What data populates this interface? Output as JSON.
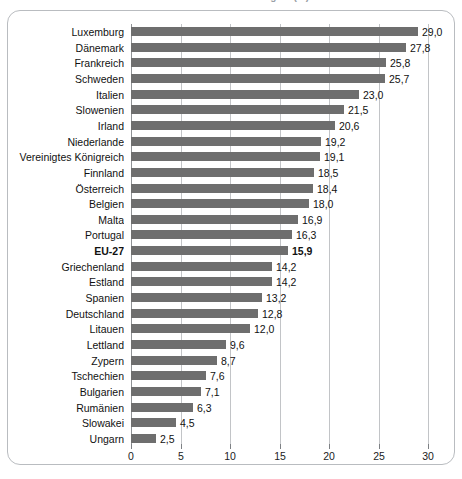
{
  "title_sliver": {
    "text": "Anteil erneuerbarer Energien (%)"
  },
  "axis": {
    "ticks": [
      "0",
      "5",
      "10",
      "15",
      "20",
      "25",
      "30"
    ],
    "min": 0,
    "max": 30,
    "step": 5
  },
  "style": {
    "bar_color": "#6e6e6e",
    "grid_color": "#c2c4c7",
    "frame_color": "#b9bcc0",
    "text_color": "#111111"
  },
  "chart_data": {
    "type": "bar",
    "orientation": "horizontal",
    "title": "Anteil erneuerbarer Energien (%)",
    "xlabel": "",
    "ylabel": "",
    "xlim": [
      0,
      30
    ],
    "xticks": [
      0,
      5,
      10,
      15,
      20,
      25,
      30
    ],
    "grid": true,
    "legend": false,
    "decimal_separator": ",",
    "categories": [
      "Luxemburg",
      "Dänemark",
      "Frankreich",
      "Schweden",
      "Italien",
      "Slowenien",
      "Irland",
      "Niederlande",
      "Vereinigtes Königreich",
      "Finnland",
      "Österreich",
      "Belgien",
      "Malta",
      "Portugal",
      "EU-27",
      "Griechenland",
      "Estland",
      "Spanien",
      "Deutschland",
      "Litauen",
      "Lettland",
      "Zypern",
      "Tschechien",
      "Bulgarien",
      "Rumänien",
      "Slowakei",
      "Ungarn"
    ],
    "values": [
      29.0,
      27.8,
      25.8,
      25.7,
      23.0,
      21.5,
      20.6,
      19.2,
      19.1,
      18.5,
      18.4,
      18.0,
      16.9,
      16.3,
      15.9,
      14.2,
      14.2,
      13.2,
      12.8,
      12.0,
      9.6,
      8.7,
      7.6,
      7.1,
      6.3,
      4.5,
      2.5
    ],
    "value_labels": [
      "29,0",
      "27,8",
      "25,8",
      "25,7",
      "23,0",
      "21,5",
      "20,6",
      "19,2",
      "19,1",
      "18,5",
      "18,4",
      "18,0",
      "16,9",
      "16,3",
      "15,9",
      "14,2",
      "14,2",
      "13,2",
      "12,8",
      "12,0",
      "9,6",
      "8,7",
      "7,6",
      "7,1",
      "6,3",
      "4,5",
      "2,5"
    ],
    "highlight_category": "EU-27"
  }
}
